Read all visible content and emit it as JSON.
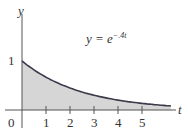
{
  "chart_data": {
    "type": "area",
    "title": "",
    "equation": "y = e^{-.4t}",
    "function": "exp(-0.4*t)",
    "xlabel": "t",
    "ylabel": "y",
    "x_ticks": [
      1,
      2,
      3,
      4,
      5
    ],
    "y_ticks": [
      1
    ],
    "origin_label": "0",
    "xlim": [
      0,
      6.2
    ],
    "ylim": [
      0,
      1.5
    ],
    "x": [
      0,
      1,
      2,
      3,
      4,
      5,
      6
    ],
    "values": [
      1.0,
      0.67,
      0.449,
      0.301,
      0.202,
      0.135,
      0.091
    ],
    "fill": "shaded area under curve",
    "grid": false
  },
  "labels": {
    "y_axis": "y",
    "t_axis": "t",
    "origin": "0",
    "y_one": "1",
    "ticks": [
      "1",
      "2",
      "3",
      "4",
      "5"
    ],
    "eq_lhs": "y = e",
    "eq_exp": "−.4t"
  },
  "colors": {
    "fill": "#d6d6d6",
    "curve": "#3a3a4a",
    "axis": "#555555"
  }
}
